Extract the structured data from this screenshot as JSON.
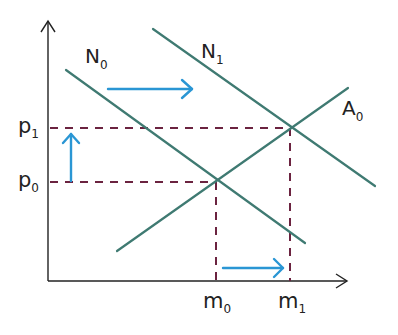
{
  "diagram": {
    "title": "",
    "colors": {
      "axis": "#222222",
      "curve": "#3f7a72",
      "guide": "#6b2340",
      "shift_arrow": "#2a96d4"
    },
    "axes": {
      "y_axis": {
        "label": ""
      },
      "x_axis": {
        "label": ""
      }
    },
    "curves": [
      {
        "id": "N0",
        "label_main": "N",
        "label_sub": "0",
        "kind": "downward-sloping"
      },
      {
        "id": "N1",
        "label_main": "N",
        "label_sub": "1",
        "kind": "downward-sloping"
      },
      {
        "id": "A0",
        "label_main": "A",
        "label_sub": "0",
        "kind": "upward-sloping"
      }
    ],
    "y_ticks": [
      {
        "id": "p0",
        "label_main": "p",
        "label_sub": "0"
      },
      {
        "id": "p1",
        "label_main": "p",
        "label_sub": "1"
      }
    ],
    "x_ticks": [
      {
        "id": "m0",
        "label_main": "m",
        "label_sub": "0"
      },
      {
        "id": "m1",
        "label_main": "m",
        "label_sub": "1"
      }
    ],
    "equilibria": [
      {
        "id": "E0",
        "curves": [
          "N0",
          "A0"
        ],
        "x": "m0",
        "y": "p0"
      },
      {
        "id": "E1",
        "curves": [
          "N1",
          "A0"
        ],
        "x": "m1",
        "y": "p1"
      }
    ],
    "shift_arrows": [
      {
        "id": "demand-shift",
        "direction": "right",
        "meaning": "N0 to N1"
      },
      {
        "id": "price-rise",
        "direction": "up",
        "meaning": "p0 to p1"
      },
      {
        "id": "quantity-rise",
        "direction": "right",
        "meaning": "m0 to m1"
      }
    ]
  }
}
